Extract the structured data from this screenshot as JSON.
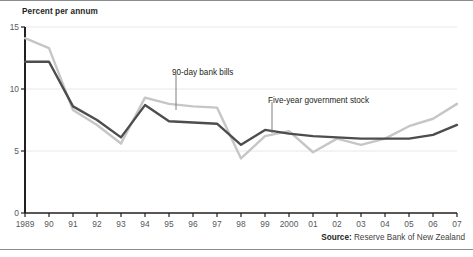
{
  "chart_data": {
    "type": "line",
    "title": "",
    "xlabel": "",
    "ylabel": "Percent per annum",
    "ylim": [
      0,
      15
    ],
    "yticks": [
      0,
      5,
      10,
      15
    ],
    "ytick_labels": [
      "0",
      "5",
      "10",
      "15"
    ],
    "grid": true,
    "grid_axis": "y",
    "legend_position": "inline-annotations",
    "x": [
      1989,
      1990,
      1991,
      1992,
      1993,
      1994,
      1995,
      1996,
      1997,
      1998,
      1999,
      2000,
      2001,
      2002,
      2003,
      2004,
      2005,
      2006,
      2007
    ],
    "xtick_labels": [
      "1989",
      "90",
      "91",
      "92",
      "93",
      "94",
      "95",
      "96",
      "97",
      "98",
      "99",
      "2000",
      "01",
      "02",
      "03",
      "04",
      "05",
      "06",
      "07"
    ],
    "series": [
      {
        "name": "90-day bank bills",
        "color": "#c6c6c6",
        "values": [
          14.1,
          13.3,
          8.3,
          7.1,
          5.6,
          9.3,
          8.8,
          8.6,
          8.5,
          4.4,
          6.2,
          6.6,
          4.9,
          6.0,
          5.5,
          6.0,
          7.0,
          7.6,
          8.8
        ]
      },
      {
        "name": "Five-year government stock",
        "color": "#4d4d4d",
        "values": [
          12.2,
          12.2,
          8.6,
          7.5,
          6.1,
          8.7,
          7.4,
          7.3,
          7.2,
          5.5,
          6.7,
          6.4,
          6.2,
          6.1,
          6.0,
          6.0,
          6.0,
          6.3,
          7.1
        ]
      }
    ],
    "annotations": [
      {
        "label": "90-day bank bills",
        "x": 1994,
        "y": 9.3
      },
      {
        "label": "Five-year government stock",
        "x": 1999,
        "y": 6.7
      }
    ]
  },
  "axis": {
    "y_title": "Percent per annum"
  },
  "source": {
    "label": "Source:",
    "text": " Reserve Bank of New Zealand"
  },
  "colors": {
    "bank_bills": "#c6c6c6",
    "govt_stock": "#4d4d4d",
    "axis": "#231f20",
    "grid": "#e8e8e8",
    "tick_text": "#58595b",
    "rule": "#8c8c8c"
  }
}
